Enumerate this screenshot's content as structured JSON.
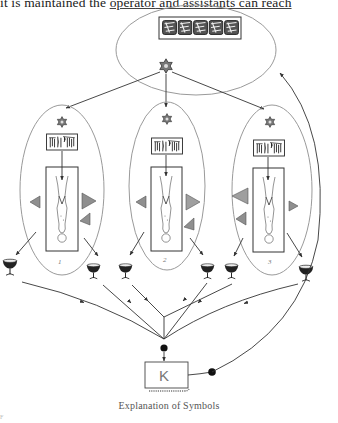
{
  "page": {
    "top_text": {
      "before": "it is maintained the ",
      "underlined_1": "operator",
      "middle": " and assistants can reach",
      "full": "it is maintained the operator and assistants can reach"
    },
    "caption": "Explanation of Symbols",
    "corner_mark": "F"
  },
  "diagram": {
    "top_group": {
      "image_strip_tiles": 5,
      "symbol": "star-of-david"
    },
    "stations": [
      {
        "label": "1",
        "symbol": "star-of-david"
      },
      {
        "label": "2",
        "symbol": "star-of-david"
      },
      {
        "label": "3",
        "symbol": "star-of-david"
      }
    ],
    "goblet_count": 6,
    "sink": {
      "label": "K"
    },
    "colors": {
      "line": "#333333",
      "ellipse": "#9a9a9a",
      "triangle_fill": "#8f8f8f"
    }
  }
}
